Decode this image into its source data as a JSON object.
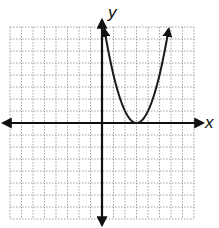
{
  "chart_data": {
    "type": "line",
    "title": "",
    "xlabel": "x",
    "ylabel": "y",
    "xlim": [
      -8,
      8
    ],
    "ylim": [
      -8,
      8
    ],
    "grid": true,
    "grid_style": "dotted",
    "tick_labels_shown": false,
    "axes_arrows": true,
    "series": [
      {
        "name": "parabola",
        "shape": "upward parabola with vertex at (3, 0), arrows at both ends",
        "vertex": [
          3,
          0
        ],
        "vertex_confidence": "exact (lands on grid intersection)",
        "approx_equation": "y = (x - 3)^2",
        "equation_confidence": "estimated from curve shape; endpoints not precisely readable",
        "points_estimated": true,
        "points": [
          [
            0.2,
            7.9
          ],
          [
            1,
            4
          ],
          [
            2,
            1
          ],
          [
            3,
            0
          ],
          [
            4,
            1
          ],
          [
            5,
            4
          ],
          [
            5.8,
            7.9
          ]
        ]
      }
    ]
  },
  "labels": {
    "x_axis": "x",
    "y_axis": "y"
  },
  "colors": {
    "axis": "#111111",
    "grid": "#8a8a8a",
    "curve": "#1a1a1a"
  }
}
